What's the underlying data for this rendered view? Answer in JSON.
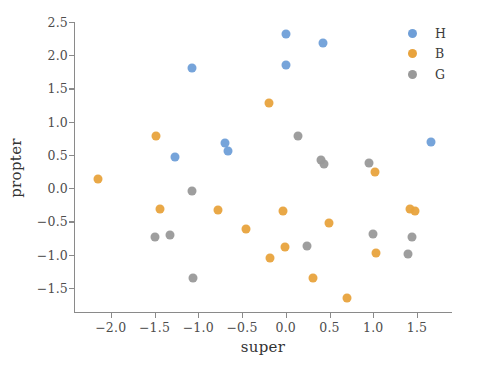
{
  "chart_data": {
    "type": "scatter",
    "title": "",
    "xlabel": "super",
    "ylabel": "propter",
    "xlim": [
      -2.42,
      1.9
    ],
    "ylim": [
      -1.88,
      2.5
    ],
    "grid": false,
    "legend_position": "upper right",
    "xticks": [
      -2.0,
      -1.5,
      -1.0,
      -0.5,
      0.0,
      0.5,
      1.0,
      1.5
    ],
    "xticklabels": [
      "−2.0",
      "−1.5",
      "−1.0",
      "−0.5",
      "0.0",
      "0.5",
      "1.0",
      "1.5"
    ],
    "yticks": [
      -1.5,
      -1.0,
      -0.5,
      0.0,
      0.5,
      1.0,
      1.5,
      2.0,
      2.5
    ],
    "yticklabels": [
      "−1.5",
      "−1.0",
      "−0.5",
      "0.0",
      "0.5",
      "1.0",
      "1.5",
      "2.0",
      "2.5"
    ],
    "colors": {
      "H": "#6f9fd8",
      "B": "#e8a33d",
      "G": "#999999"
    },
    "series": [
      {
        "name": "H",
        "color": "#6f9fd8",
        "points": [
          [
            -1.07,
            1.81
          ],
          [
            -1.27,
            0.47
          ],
          [
            -0.69,
            0.68
          ],
          [
            -0.66,
            0.56
          ],
          [
            0.0,
            2.32
          ],
          [
            0.0,
            1.86
          ],
          [
            0.42,
            2.19
          ],
          [
            1.66,
            0.69
          ]
        ]
      },
      {
        "name": "B",
        "color": "#e8a33d",
        "points": [
          [
            -2.15,
            0.13
          ],
          [
            -1.48,
            0.79
          ],
          [
            -1.44,
            -0.31
          ],
          [
            -0.77,
            -0.33
          ],
          [
            -0.45,
            -0.61
          ],
          [
            -0.19,
            1.28
          ],
          [
            -0.18,
            -1.05
          ],
          [
            -0.03,
            -0.35
          ],
          [
            -0.01,
            -0.89
          ],
          [
            0.31,
            -1.35
          ],
          [
            0.49,
            -0.53
          ],
          [
            0.7,
            -1.65
          ],
          [
            1.02,
            0.24
          ],
          [
            1.03,
            -0.98
          ],
          [
            1.42,
            -0.32
          ],
          [
            1.48,
            -0.35
          ]
        ]
      },
      {
        "name": "G",
        "color": "#999999",
        "points": [
          [
            -1.49,
            -0.73
          ],
          [
            -1.32,
            -0.71
          ],
          [
            -1.07,
            -0.05
          ],
          [
            -1.06,
            -1.36
          ],
          [
            0.14,
            0.79
          ],
          [
            0.24,
            -0.87
          ],
          [
            0.4,
            0.43
          ],
          [
            0.44,
            0.37
          ],
          [
            0.95,
            0.38
          ],
          [
            1.0,
            -0.69
          ],
          [
            1.4,
            -0.99
          ],
          [
            1.44,
            -0.73
          ]
        ]
      }
    ]
  },
  "legend": {
    "entries": [
      {
        "label": "H",
        "color": "#6f9fd8"
      },
      {
        "label": "B",
        "color": "#e8a33d"
      },
      {
        "label": "G",
        "color": "#999999"
      }
    ]
  }
}
